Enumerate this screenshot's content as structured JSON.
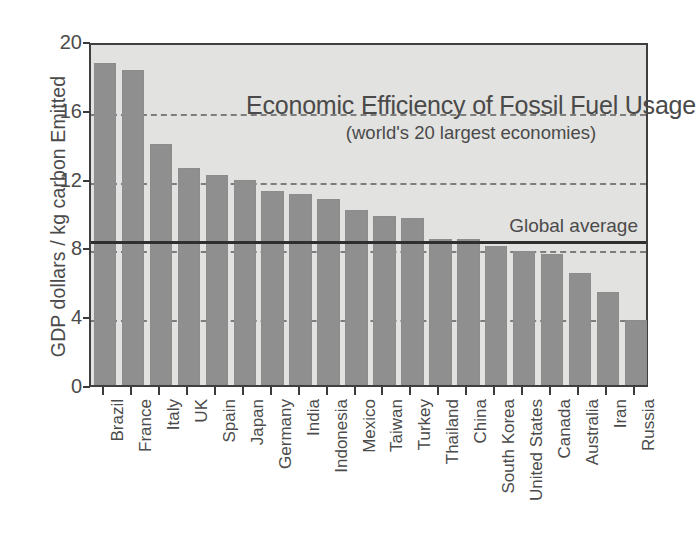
{
  "chart_data": {
    "type": "bar",
    "title": "Economic Efficiency of Fossil Fuel Usage",
    "subtitle": "(world's 20 largest economies)",
    "xlabel": "",
    "ylabel": "GDP dollars / kg carbon Emitted",
    "ylim": [
      0,
      20
    ],
    "yticks": [
      0,
      4,
      8,
      12,
      16,
      20
    ],
    "ytick_labels": [
      "0",
      "4",
      "8",
      "12",
      "16",
      "20"
    ],
    "grid": "horizontal-dashed-at-4-8-12-16",
    "legend": "none",
    "categories": [
      "Brazil",
      "France",
      "Italy",
      "UK",
      "Spain",
      "Japan",
      "Germany",
      "India",
      "Indonesia",
      "Mexico",
      "Taiwan",
      "Turkey",
      "Thailand",
      "China",
      "South Korea",
      "United States",
      "Canada",
      "Australia",
      "Iran",
      "Russia"
    ],
    "values": [
      18.7,
      18.3,
      14.0,
      12.6,
      12.2,
      11.9,
      11.3,
      11.1,
      10.8,
      10.2,
      9.8,
      9.7,
      8.5,
      8.5,
      8.1,
      7.8,
      7.6,
      6.5,
      5.4,
      3.8
    ],
    "annotations": [
      {
        "name": "global-average",
        "label": "Global average",
        "value": 8.5,
        "style": "solid-horizontal-line"
      }
    ],
    "colors": {
      "bar": "#8f8f8f",
      "plot_background": "#e2e2e0",
      "axis": "#3f3f3f",
      "gridline": "#7d7d7d",
      "average_line": "#2f2f2f",
      "text": "#4a4a4a",
      "page_background": "#ffffff"
    }
  }
}
